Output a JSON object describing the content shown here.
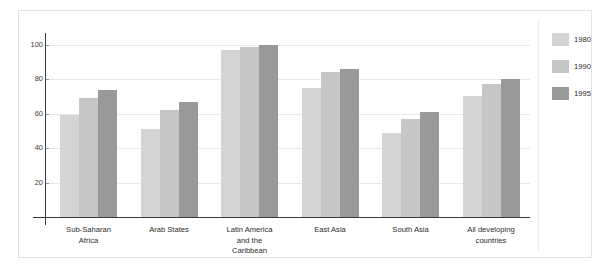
{
  "chart_data": {
    "type": "bar",
    "title": "",
    "subtitle": "",
    "xlabel": "",
    "ylabel": "",
    "ylim": [
      0,
      108
    ],
    "yticks": [
      20,
      40,
      60,
      80,
      100
    ],
    "ytick_labels": [
      "20",
      "40",
      "60",
      "80",
      "100"
    ],
    "grid": true,
    "legend_position": "right",
    "categories": [
      "Sub-Saharan Africa",
      "Arab States",
      "Latin America and the Caribbean",
      "East Asia",
      "South Asia",
      "All developing countries"
    ],
    "series": [
      {
        "name": "1980",
        "color": "#d4d4d4",
        "values": [
          59,
          51,
          97,
          75,
          49,
          70
        ]
      },
      {
        "name": "1990",
        "color": "#c6c6c6",
        "values": [
          69,
          62,
          99,
          84,
          57,
          77
        ]
      },
      {
        "name": "1995",
        "color": "#999999",
        "values": [
          74,
          67,
          100,
          86,
          61,
          80
        ]
      }
    ]
  },
  "legend": {
    "items": [
      {
        "label": "1980",
        "color": "#d4d4d4"
      },
      {
        "label": "1990",
        "color": "#c6c6c6"
      },
      {
        "label": "1995",
        "color": "#999999"
      }
    ]
  },
  "axis": {
    "y_tick_labels": [
      "100",
      "80",
      "60",
      "40",
      "20"
    ]
  },
  "categories_display": [
    "Sub-Saharan\nAfrica",
    "Arab States",
    "Latin America\nand the\nCaribbean",
    "East Asia",
    "South Asia",
    "All developing\ncountries"
  ]
}
